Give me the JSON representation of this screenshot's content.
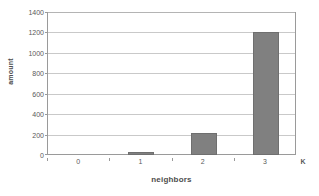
{
  "chart_data": {
    "type": "bar",
    "title": "",
    "subtitle": "",
    "xlabel": "neighbors",
    "ylabel": "amount",
    "categories": [
      "0",
      "1",
      "2",
      "3"
    ],
    "values": [
      0,
      25,
      220,
      1205
    ],
    "series": [
      {
        "name": "amount",
        "values": [
          0,
          25,
          220,
          1205
        ]
      }
    ],
    "ylim": [
      0,
      1400
    ],
    "ytick_step": 200,
    "yticks": [
      "1400",
      "1200",
      "1000",
      "800",
      "600",
      "400",
      "200",
      "0"
    ],
    "ytick_values": [
      1400,
      1200,
      1000,
      800,
      600,
      400,
      200,
      0
    ],
    "xticks": [
      "0",
      "1",
      "2",
      "3"
    ],
    "grid": true,
    "grid_axis": "y",
    "legend": false,
    "legend_position": "none",
    "annotations": [
      {
        "name": "axis-end-marker",
        "text": "K",
        "position": "x-axis-right-end"
      }
    ],
    "bar_color": "#808080",
    "bar_edge_color": "#6f6f6f",
    "grid_color": "#c9c9c9",
    "axis_color": "#9a9a9a",
    "text_color": "#595959",
    "background_color": "#ffffff"
  }
}
